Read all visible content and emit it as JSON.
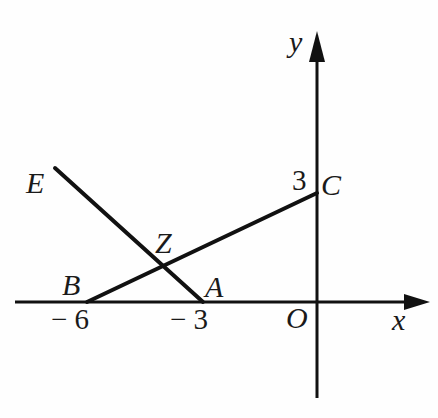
{
  "figure": {
    "type": "geometry-diagram",
    "background_color": "#fefefe",
    "stroke_color": "#111111",
    "width": 438,
    "height": 418
  },
  "axes": {
    "x_label": "x",
    "y_label": "y",
    "origin_label": "O",
    "origin_px": {
      "x": 317,
      "y": 302
    },
    "unit_px_x": 38,
    "unit_px_y": 36,
    "x_axis": {
      "x1": 15,
      "y1": 302,
      "x2": 428,
      "y2": 302,
      "arrow": "right"
    },
    "y_axis": {
      "x1": 317,
      "y1": 398,
      "x2": 317,
      "y2": 32,
      "arrow": "up"
    }
  },
  "ticks": [
    {
      "name": "tick-minus-6",
      "label": "− 6",
      "axis": "x",
      "value": -6,
      "px": {
        "x": 87,
        "y": 302
      }
    },
    {
      "name": "tick-minus-3",
      "label": "− 3",
      "axis": "x",
      "value": -3,
      "px": {
        "x": 203,
        "y": 302
      }
    },
    {
      "name": "tick-3",
      "label": "3",
      "axis": "y",
      "value": 3,
      "px": {
        "x": 317,
        "y": 193
      }
    }
  ],
  "points": [
    {
      "id": "E",
      "label": "E",
      "px": {
        "x": 55,
        "y": 168
      },
      "coord": null
    },
    {
      "id": "B",
      "label": "B",
      "px": {
        "x": 87,
        "y": 302
      },
      "coord": [
        -6,
        0
      ]
    },
    {
      "id": "Z",
      "label": "Z",
      "px": {
        "x": 158,
        "y": 265
      },
      "coord": null
    },
    {
      "id": "A",
      "label": "A",
      "px": {
        "x": 203,
        "y": 302
      },
      "coord": [
        -3,
        0
      ]
    },
    {
      "id": "C",
      "label": "C",
      "px": {
        "x": 317,
        "y": 193
      },
      "coord": [
        0,
        3
      ]
    }
  ],
  "segments": [
    {
      "id": "BC",
      "from": "B",
      "to": "C",
      "x1": 87,
      "y1": 302,
      "x2": 317,
      "y2": 193
    },
    {
      "id": "EA",
      "from": "E",
      "to": "A",
      "x1": 55,
      "y1": 168,
      "x2": 203,
      "y2": 302
    }
  ]
}
